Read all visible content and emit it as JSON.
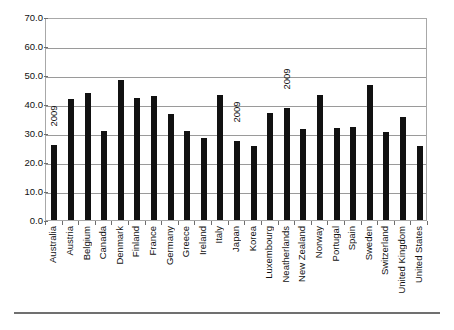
{
  "figure": {
    "title_remnant": "",
    "footer_rule": true
  },
  "chart_data": {
    "type": "bar",
    "title": "",
    "subtitle": "",
    "xlabel": "",
    "ylabel": "",
    "ylim": [
      0.0,
      70.0
    ],
    "ytick_step": 10.0,
    "ytick_labels": [
      "70.0",
      "60.0",
      "50.0",
      "40.0",
      "30.0",
      "20.0",
      "10.0",
      "0.0"
    ],
    "ytick_values": [
      70.0,
      60.0,
      50.0,
      40.0,
      30.0,
      20.0,
      10.0,
      0.0
    ],
    "grid": true,
    "grid_axis": "y",
    "legend": false,
    "legend_position": "none",
    "bar_color": "#111111",
    "categories": [
      "Australia",
      "Austria",
      "Belgium",
      "Canada",
      "Denmark",
      "Finland",
      "France",
      "Germany",
      "Greece",
      "Ireland",
      "Italy",
      "Japan",
      "Korea",
      "Luxembourg",
      "Neatherlands",
      "New Zealand",
      "Norway",
      "Portugal",
      "Spain",
      "Sweden",
      "Switzerland",
      "United Kingdom",
      "United States"
    ],
    "values": [
      25.8,
      41.8,
      43.7,
      30.8,
      48.3,
      42.1,
      42.9,
      36.4,
      30.8,
      28.2,
      43.2,
      27.2,
      25.4,
      37.0,
      38.5,
      31.5,
      43.2,
      31.6,
      32.0,
      46.4,
      30.4,
      35.6,
      25.4
    ],
    "annotations": [
      {
        "category": "Australia",
        "text": "2009",
        "rotation": -90
      },
      {
        "category": "Japan",
        "text": "2009",
        "rotation": -90
      },
      {
        "category": "Neatherlands",
        "text": "2009",
        "rotation": -90
      }
    ]
  }
}
